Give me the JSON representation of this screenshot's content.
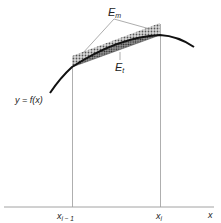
{
  "diagram": {
    "type": "trapezoidal-vs-midpoint-error",
    "curve_label": "y = f(x)",
    "x_axis_label": "x",
    "tick_labels": [
      {
        "main": "x",
        "sub": "i − 1"
      },
      {
        "main": "x",
        "sub": "i"
      }
    ],
    "error_labels": {
      "midpoint": {
        "main": "E",
        "sub": "m"
      },
      "trapezoidal": {
        "main": "E",
        "sub": "t"
      }
    },
    "colors": {
      "line": "#111111",
      "guide": "#9a9a9a",
      "hatch": "#6e6e6e",
      "background": "#ffffff"
    }
  }
}
